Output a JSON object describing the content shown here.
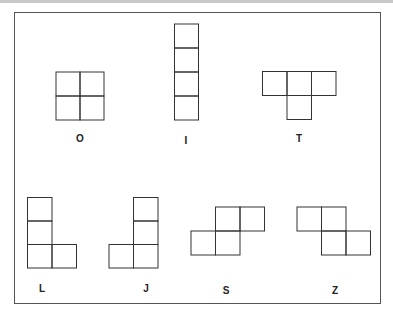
{
  "stroke_color": "#333333",
  "pieces": [
    {
      "id": "O",
      "label": "O",
      "label_pos": [
        80,
        138
      ]
    },
    {
      "id": "I",
      "label": "I",
      "label_pos": [
        186,
        140
      ]
    },
    {
      "id": "T",
      "label": "T",
      "label_pos": [
        299,
        138
      ]
    },
    {
      "id": "L",
      "label": "L",
      "label_pos": [
        42,
        288
      ]
    },
    {
      "id": "J",
      "label": "J",
      "label_pos": [
        146,
        288
      ]
    },
    {
      "id": "S",
      "label": "S",
      "label_pos": [
        226,
        290
      ]
    },
    {
      "id": "Z",
      "label": "Z",
      "label_pos": [
        335,
        290
      ]
    }
  ]
}
